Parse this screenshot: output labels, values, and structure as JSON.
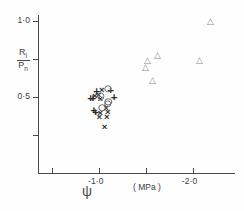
{
  "chart_data": {
    "type": "scatter",
    "title": "",
    "xlabel": "ψ  ( MPa )",
    "ylabel": "Rl/Pn",
    "ylabel_numerator": "R",
    "ylabel_numerator_sub": "l",
    "ylabel_denominator": "P",
    "ylabel_denominator_sub": "n",
    "xlim": [
      -0.35,
      -2.45
    ],
    "ylim": [
      0.0,
      1.04
    ],
    "grid": false,
    "legend": "none",
    "x_ticks": [
      -0.5,
      -1.0,
      -1.5,
      -2.0
    ],
    "x_tick_labels": [
      "",
      "-1·0",
      "",
      "-2·0"
    ],
    "y_ticks": [
      0.25,
      0.5,
      0.75,
      1.0
    ],
    "y_tick_labels": [
      "",
      "0·5",
      "",
      "1·0"
    ],
    "units": "MPa",
    "axis_symbol": "ψ",
    "series": [
      {
        "name": "triangles",
        "marker": "triangle",
        "color": "#8a8a8a",
        "points": [
          [
            -2.19,
            1.0
          ],
          [
            -1.52,
            0.745
          ],
          [
            -1.62,
            0.775
          ],
          [
            -2.07,
            0.745
          ],
          [
            -1.5,
            0.695
          ],
          [
            -1.57,
            0.615
          ]
        ]
      },
      {
        "name": "crosses",
        "marker": "cross",
        "color": "#2b2b2b",
        "points": [
          [
            -1.03,
            0.545
          ],
          [
            -0.995,
            0.515
          ],
          [
            -1.015,
            0.49
          ],
          [
            -0.955,
            0.505
          ],
          [
            -1.075,
            0.425
          ],
          [
            -1.095,
            0.4
          ],
          [
            -1.085,
            0.368
          ],
          [
            -1.015,
            0.395
          ],
          [
            -1.005,
            0.372
          ],
          [
            -1.06,
            0.3
          ]
        ]
      },
      {
        "name": "pluses",
        "marker": "plus",
        "color": "#2b2b2b",
        "points": [
          [
            -0.975,
            0.535
          ],
          [
            -1.125,
            0.543
          ],
          [
            -0.91,
            0.487
          ],
          [
            -1.16,
            0.495
          ],
          [
            -0.935,
            0.488
          ],
          [
            -0.945,
            0.408
          ],
          [
            -0.965,
            0.392
          ]
        ]
      },
      {
        "name": "circles",
        "marker": "circle",
        "color": "#6b6b6b",
        "points": [
          [
            -1.095,
            0.555
          ],
          [
            -1.02,
            0.505
          ],
          [
            -1.1,
            0.47
          ],
          [
            -1.095,
            0.455
          ],
          [
            -1.035,
            0.43
          ]
        ]
      }
    ]
  },
  "axes": {
    "y_title_parts": {
      "num": "R",
      "num_sub": "l",
      "den": "P",
      "den_sub": "n"
    },
    "x_title": "( MPa )",
    "psi": "ψ"
  }
}
